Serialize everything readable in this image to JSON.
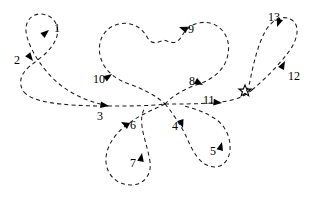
{
  "figure": {
    "type": "trajectory-diagram",
    "background_color": "#ffffff",
    "stroke_color": "#1a1a1a",
    "line_style": "dashed",
    "width": 320,
    "height": 207
  },
  "marker": {
    "name": "star",
    "glyph": "star-5-point",
    "x": 245,
    "y": 91,
    "label": ""
  },
  "junction": {
    "label": "",
    "x": 165,
    "y": 104
  },
  "steps": [
    {
      "id": "1",
      "label": "1",
      "label_x": 54,
      "label_y": 22,
      "arrow_x": 49,
      "arrow_y": 30,
      "arrow_angle": -40
    },
    {
      "id": "2",
      "label": "2",
      "label_x": 14,
      "label_y": 54,
      "arrow_x": 33,
      "arrow_y": 61,
      "arrow_angle": 52
    },
    {
      "id": "3",
      "label": "3",
      "label_x": 97,
      "label_y": 110,
      "arrow_x": 109,
      "arrow_y": 106,
      "arrow_angle": 8
    },
    {
      "id": "4",
      "label": "4",
      "label_x": 172,
      "label_y": 120,
      "arrow_x": 183,
      "arrow_y": 128,
      "arrow_angle": 72
    },
    {
      "id": "5",
      "label": "5",
      "label_x": 210,
      "label_y": 145,
      "arrow_x": 222,
      "arrow_y": 142,
      "arrow_angle": -75
    },
    {
      "id": "6",
      "label": "6",
      "label_x": 130,
      "label_y": 119,
      "arrow_x": 121,
      "arrow_y": 122,
      "arrow_angle": 208
    },
    {
      "id": "7",
      "label": "7",
      "label_x": 130,
      "label_y": 157,
      "arrow_x": 142,
      "arrow_y": 153,
      "arrow_angle": -80
    },
    {
      "id": "8",
      "label": "8",
      "label_x": 189,
      "label_y": 75,
      "arrow_x": 203,
      "arrow_y": 85,
      "arrow_angle": 28
    },
    {
      "id": "9",
      "label": "9",
      "label_x": 188,
      "label_y": 23,
      "arrow_x": 179,
      "arrow_y": 27,
      "arrow_angle": 200
    },
    {
      "id": "10",
      "label": "10",
      "label_x": 93,
      "label_y": 73,
      "arrow_x": 112,
      "arrow_y": 74,
      "arrow_angle": -35
    },
    {
      "id": "11",
      "label": "11",
      "label_x": 203,
      "label_y": 94,
      "arrow_x": 222,
      "arrow_y": 103,
      "arrow_angle": 6
    },
    {
      "id": "12",
      "label": "12",
      "label_x": 288,
      "label_y": 70,
      "arrow_x": 285,
      "arrow_y": 61,
      "arrow_angle": -62
    },
    {
      "id": "13",
      "label": "13",
      "label_x": 268,
      "label_y": 11,
      "arrow_x": 277,
      "arrow_y": 27,
      "arrow_angle": 110
    }
  ],
  "paths": {
    "left_loop": "M 108 106 C 95 103 74 97 58 83 C 42 69 32 52 28 40 C 22 24 30 14 40 14 C 52 14 60 24 57 36 C 53 50 40 58 30 66 C 20 74 18 84 24 92",
    "left_tail": "M 24 92 C 32 102 60 106 108 106",
    "center_left_in": "M 108 106 C 128 106 150 106 165 104",
    "heart": "M 165 104 C 172 96 186 88 199 84 C 214 79 226 68 228 54 C 231 38 222 26 210 23 C 196 20 186 28 182 36 C 176 46 170 42 164 40 C 158 42 152 46 147 37 C 142 28 132 21 119 24 C 105 27 97 40 100 55 C 103 70 115 79 129 84 C 143 89 157 96 165 104",
    "right_line": "M 165 104 C 190 104 216 104 232 100 C 240 98 246 95 252 90",
    "right_loop": "M 252 90 C 266 78 280 64 290 50 C 298 38 300 26 292 20 C 283 14 272 20 266 30 C 258 44 254 62 251 76 C 249 88 246 93 243 96",
    "lower_left_loop": "M 165 104 C 152 110 138 116 128 124 C 114 134 105 148 106 162 C 107 176 118 185 131 185 C 144 185 152 174 150 162 C 148 148 143 136 142 126 C 141 118 142 112 145 108",
    "lower_right_loop": "M 165 104 C 172 112 180 124 186 136 C 192 150 198 162 209 166 C 220 170 229 162 230 150 C 231 136 224 124 214 118 C 203 111 192 108 184 106"
  }
}
